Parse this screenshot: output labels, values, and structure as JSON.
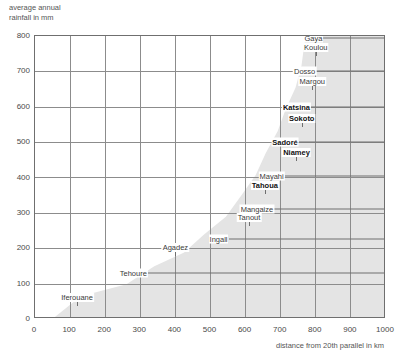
{
  "chart_data": {
    "type": "scatter",
    "title": "",
    "ylabel": "average annual\nrainfall in mm",
    "xlabel": "distance from 20th parallel in km",
    "xlim": [
      0,
      1000
    ],
    "ylim": [
      0,
      800
    ],
    "xticks": [
      0,
      100,
      200,
      300,
      400,
      500,
      600,
      700,
      800,
      900,
      1000
    ],
    "yticks": [
      0,
      100,
      200,
      300,
      400,
      500,
      600,
      700,
      800
    ],
    "grid": true,
    "legend": "none",
    "shaded_band_color": "#e4e4e4",
    "shaded_band_note": "Grey band rising left-to-right marks the rainfall/distance relationship envelope",
    "points": [
      {
        "label": "Iferouane",
        "x": 120,
        "y": 40,
        "bold": false,
        "anchor": "below"
      },
      {
        "label": "Tehoure",
        "x": 330,
        "y": 130,
        "bold": false,
        "anchor": "left"
      },
      {
        "label": "Agadez",
        "x": 400,
        "y": 180,
        "bold": false,
        "anchor": "below"
      },
      {
        "label": "Ingall",
        "x": 560,
        "y": 225,
        "bold": false,
        "anchor": "left"
      },
      {
        "label": "Tanout",
        "x": 610,
        "y": 265,
        "bold": false,
        "anchor": "below"
      },
      {
        "label": "Mangaize",
        "x": 690,
        "y": 310,
        "bold": false,
        "anchor": "left"
      },
      {
        "label": "Tahoua",
        "x": 655,
        "y": 355,
        "bold": true,
        "anchor": "below"
      },
      {
        "label": "Mayahi",
        "x": 720,
        "y": 405,
        "bold": false,
        "anchor": "left"
      },
      {
        "label": "Niamey",
        "x": 745,
        "y": 450,
        "bold": true,
        "anchor": "below"
      },
      {
        "label": "Sadoré",
        "x": 760,
        "y": 500,
        "bold": true,
        "anchor": "left"
      },
      {
        "label": "Sokoto",
        "x": 760,
        "y": 545,
        "bold": true,
        "anchor": "below"
      },
      {
        "label": "Katsina",
        "x": 795,
        "y": 600,
        "bold": true,
        "anchor": "left"
      },
      {
        "label": "Margou",
        "x": 790,
        "y": 650,
        "bold": false,
        "anchor": "below"
      },
      {
        "label": "Dosso",
        "x": 810,
        "y": 700,
        "bold": false,
        "anchor": "left"
      },
      {
        "label": "Koulou",
        "x": 800,
        "y": 745,
        "bold": false,
        "anchor": "below"
      },
      {
        "label": "Gaya",
        "x": 830,
        "y": 795,
        "bold": false,
        "anchor": "left"
      }
    ]
  },
  "axes": {
    "y_title": "average annual\nrainfall in mm",
    "x_title": "distance from 20th parallel in km"
  }
}
